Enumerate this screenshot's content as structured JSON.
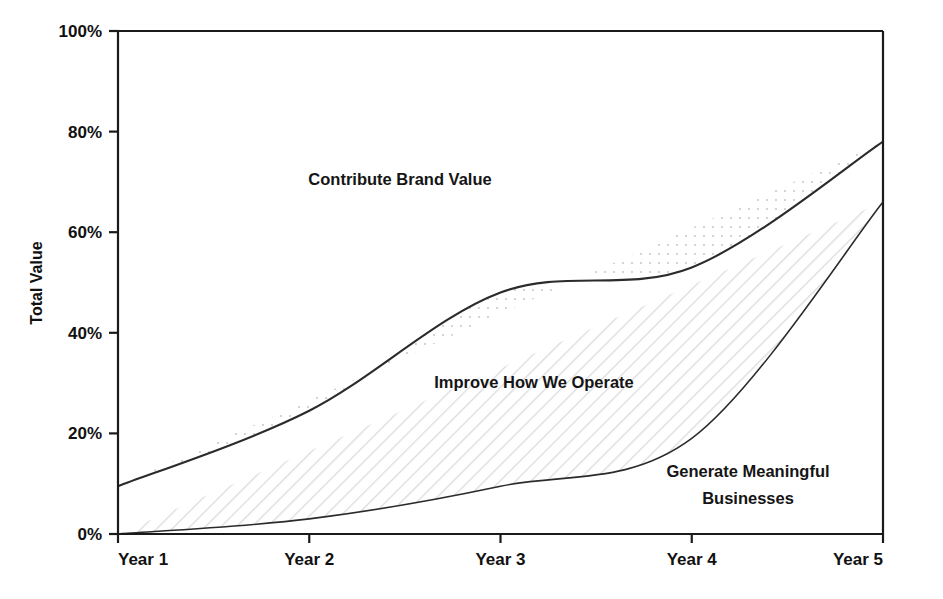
{
  "chart_data": {
    "type": "area",
    "stacked": true,
    "title": "",
    "xlabel": "",
    "ylabel": "Total Value",
    "categories": [
      "Year 1",
      "Year 2",
      "Year 3",
      "Year 4",
      "Year 5"
    ],
    "x": [
      1,
      2,
      3,
      4,
      5
    ],
    "ylim": [
      0,
      100
    ],
    "ytick_labels": [
      "0%",
      "20%",
      "40%",
      "60%",
      "80%",
      "100%"
    ],
    "ytick_values": [
      0,
      20,
      40,
      60,
      80,
      100
    ],
    "grid": false,
    "legend": "inline-labels",
    "series": [
      {
        "name": "Generate Meaningful Businesses",
        "values": [
          0,
          3,
          9.5,
          19,
          66
        ],
        "fill": "#ffffff",
        "pattern": "diagonal-hatch",
        "label_line1": "Generate Meaningful",
        "label_line2": "Businesses"
      },
      {
        "name": "Improve How We Operate",
        "values": [
          9.5,
          21.5,
          38.5,
          34,
          12
        ],
        "cumulative_top": [
          9.5,
          24.5,
          48,
          53,
          78
        ],
        "fill": "#ffffff",
        "pattern": "dots",
        "label_line1": "Improve How We Operate",
        "label_line2": ""
      },
      {
        "name": "Contribute Brand Value",
        "values": [
          90.5,
          75.5,
          52,
          47,
          22
        ],
        "cumulative_top": [
          100,
          100,
          100,
          100,
          100
        ],
        "fill": "#d9d9d9",
        "pattern": "solid-gray",
        "label_line1": "Contribute Brand Value",
        "label_line2": ""
      }
    ],
    "colors": {
      "band_top": "#d9d9d9",
      "band_middle": "#ffffff",
      "band_bottom": "#ffffff",
      "axis": "#1a1a1a",
      "line": "#2b2b2b",
      "text": "#111111"
    }
  }
}
